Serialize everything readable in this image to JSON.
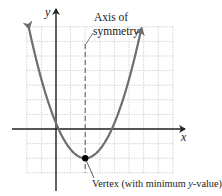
{
  "diagram": {
    "axes": {
      "x_label": "x",
      "y_label": "y"
    },
    "annotations": {
      "axis_of_symmetry_line1": "Axis of",
      "axis_of_symmetry_line2": "symmetry",
      "vertex_prefix": "Vertex (with minimum ",
      "vertex_var": "y",
      "vertex_suffix": "-value)"
    },
    "grid": {
      "x_min": -2,
      "x_max": 8,
      "y_min": -3,
      "y_max": 7,
      "unit_px": 14.6,
      "origin_px": [
        56,
        129
      ]
    },
    "parabola": {
      "a": 0.6,
      "h": 2,
      "k": -2,
      "x_from": -1.85,
      "x_to": 5.85,
      "opens": "up"
    },
    "vertex": {
      "x": 2,
      "y": -2
    },
    "axis_of_symmetry_x": 2,
    "colors": {
      "curve": "#6e6e6e",
      "axes": "#222222",
      "grid": "#b5b5b5",
      "vertex": "#000000",
      "dashed": "#555555"
    }
  }
}
